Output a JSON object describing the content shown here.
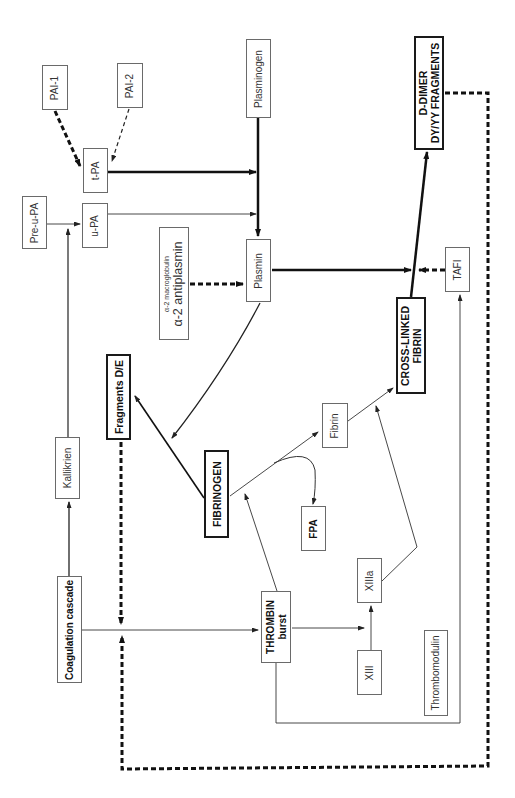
{
  "diagram": {
    "type": "flowchart",
    "orientation": "rotated-90-ccw",
    "nodes": {
      "pai1": {
        "label": "PAI-1"
      },
      "pai2": {
        "label": "PAI-2"
      },
      "tpa": {
        "label": "t-PA"
      },
      "preupa": {
        "label": "Pre-u-PA"
      },
      "upa": {
        "label": "u-PA"
      },
      "plasminogen": {
        "label": "Plasminogen"
      },
      "antiplasmin": {
        "line1": "α-2 macroglobulin",
        "line2": "α-2 antiplasmin"
      },
      "plasmin": {
        "label": "Plasmin"
      },
      "ddimer": {
        "line1": "D-DIMER",
        "line2": "DY/YY FRAGMENTS"
      },
      "tafi": {
        "label": "TAFI"
      },
      "crosslinked": {
        "line1": "CROSS-LINKED",
        "line2": "FIBRIN"
      },
      "fragments": {
        "label": "Fragments D/E"
      },
      "fibrin": {
        "label": "Fibrin"
      },
      "kallikrien": {
        "label": "Kallikrien"
      },
      "fibrinogen": {
        "label": "FIBRINOGEN"
      },
      "fpa": {
        "label": "FPA"
      },
      "coagulation": {
        "label": "Coagulation cascade"
      },
      "thrombin": {
        "line1": "THROMBIN",
        "line2": "burst"
      },
      "xiiia": {
        "label": "XIIIa"
      },
      "xiii": {
        "label": "XIII"
      },
      "thrombomodulin": {
        "label": "Thrombomodulin"
      }
    },
    "edges": [
      {
        "from": "PAI-1",
        "to": "t-PA",
        "style": "dashed-thick",
        "meaning": "inhibits"
      },
      {
        "from": "PAI-2",
        "to": "t-PA",
        "style": "dashed-thin",
        "meaning": "inhibits"
      },
      {
        "from": "t-PA",
        "to": "Plasminogen→Plasmin",
        "style": "solid-thick"
      },
      {
        "from": "u-PA",
        "to": "Plasminogen→Plasmin",
        "style": "solid-thin"
      },
      {
        "from": "Pre-u-PA",
        "to": "u-PA",
        "style": "solid-thin"
      },
      {
        "from": "Kallikrien",
        "to": "Pre-u-PA→u-PA",
        "style": "solid"
      },
      {
        "from": "Coagulation cascade",
        "to": "Kallikrien",
        "style": "solid"
      },
      {
        "from": "Plasminogen",
        "to": "Plasmin",
        "style": "solid-thick"
      },
      {
        "from": "α-2 macroglobulin / α-2 antiplasmin",
        "to": "Plasmin",
        "style": "dashed-thick",
        "meaning": "inhibits"
      },
      {
        "from": "Plasmin",
        "to": "Cross-linked fibrin→D-Dimer",
        "style": "solid-thick"
      },
      {
        "from": "TAFI",
        "to": "Plasmin→Cross-linked fibrin",
        "style": "dashed-thick",
        "meaning": "inhibits"
      },
      {
        "from": "Cross-linked fibrin",
        "to": "D-DIMER DY/YY fragments",
        "style": "solid-thick"
      },
      {
        "from": "Plasmin",
        "to": "FIBRINOGEN",
        "style": "solid"
      },
      {
        "from": "FIBRINOGEN",
        "to": "Fragments D/E",
        "style": "solid"
      },
      {
        "from": "FIBRINOGEN",
        "to": "Fibrin",
        "style": "solid-thin"
      },
      {
        "from": "FIBRINOGEN→Fibrin",
        "to": "FPA",
        "style": "curved-thin"
      },
      {
        "from": "Fibrin",
        "to": "Cross-linked fibrin",
        "style": "solid-thin"
      },
      {
        "from": "THROMBIN burst",
        "to": "FIBRINOGEN→Fibrin",
        "style": "solid-thin"
      },
      {
        "from": "THROMBIN burst",
        "to": "XIIIa",
        "style": "solid-thin"
      },
      {
        "from": "XIII",
        "to": "XIIIa",
        "style": "solid-thin"
      },
      {
        "from": "XIIIa",
        "to": "Fibrin→Cross-linked fibrin",
        "style": "solid-thin"
      },
      {
        "from": "THROMBIN burst",
        "to": "TAFI",
        "style": "solid-thin",
        "via": "Thrombomodulin loop"
      },
      {
        "from": "Coagulation cascade",
        "to": "THROMBIN burst",
        "style": "solid-thin"
      },
      {
        "from": "Fragments D/E",
        "to": "Coagulation cascade→Thrombin",
        "style": "dashed-thick",
        "meaning": "feedback"
      },
      {
        "from": "D-DIMER DY/YY fragments",
        "to": "Coagulation cascade→Thrombin",
        "style": "dashed-thick",
        "meaning": "feedback"
      }
    ]
  }
}
